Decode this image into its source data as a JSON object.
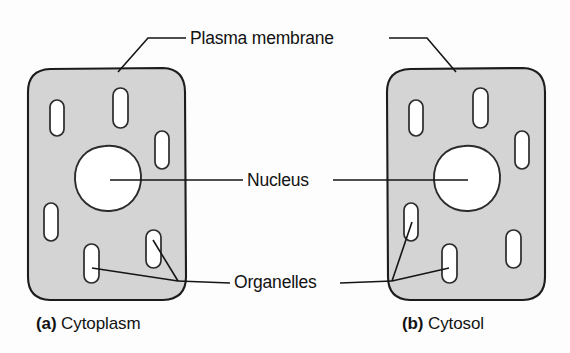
{
  "figure": {
    "background_color": "#fdfdfd",
    "width": 570,
    "height": 353
  },
  "style": {
    "cytoplasm_fill": "#d4d4d4",
    "membrane_stroke": "#1c1c1c",
    "nucleus_fill": "#ffffff",
    "organelle_fill": "#ffffff",
    "organelle_stroke": "#2b2b2b",
    "leader_stroke": "#151515",
    "text_color": "#121212"
  },
  "labels": {
    "plasma_membrane": "Plasma membrane",
    "nucleus": "Nucleus",
    "organelles": "Organelles"
  },
  "panels": [
    {
      "id": "a",
      "letter": "(a)",
      "name": "Cytoplasm",
      "caption": "Cytoplasm",
      "organelle_count": 6
    },
    {
      "id": "b",
      "letter": "(b)",
      "name": "Cytosol",
      "caption": "Cytosol",
      "organelle_count": 6
    }
  ]
}
